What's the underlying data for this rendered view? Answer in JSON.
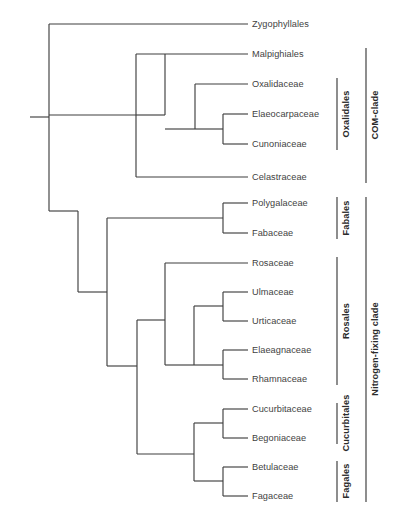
{
  "figure": {
    "type": "phylogenetic-cladogram",
    "background_color": "#ffffff",
    "line_color": "#3f3f3f",
    "text_color": "#3f3f3f",
    "width": 404,
    "height": 521
  },
  "taxa": [
    {
      "id": "zygophyllales",
      "label": "Zygophyllales",
      "x": 252,
      "y": 24
    },
    {
      "id": "malpighiales",
      "label": "Malpighiales",
      "x": 252,
      "y": 54
    },
    {
      "id": "oxalidaceae",
      "label": "Oxalidaceae",
      "x": 252,
      "y": 84
    },
    {
      "id": "elaeocarpaceae",
      "label": "Elaeocarpaceae",
      "x": 252,
      "y": 114
    },
    {
      "id": "cunoniaceae",
      "label": "Cunoniaceae",
      "x": 252,
      "y": 144
    },
    {
      "id": "celastraceae",
      "label": "Celastraceae",
      "x": 252,
      "y": 177
    },
    {
      "id": "polygalaceae",
      "label": "Polygalaceae",
      "x": 252,
      "y": 203
    },
    {
      "id": "fabaceae",
      "label": "Fabaceae",
      "x": 252,
      "y": 233
    },
    {
      "id": "rosaceae",
      "label": "Rosaceae",
      "x": 252,
      "y": 263
    },
    {
      "id": "ulmaceae",
      "label": "Ulmaceae",
      "x": 252,
      "y": 292
    },
    {
      "id": "urticaceae",
      "label": "Urticaceae",
      "x": 252,
      "y": 321
    },
    {
      "id": "elaeagnaceae",
      "label": "Elaeagnaceae",
      "x": 252,
      "y": 350
    },
    {
      "id": "rhamnaceae",
      "label": "Rhamnaceae",
      "x": 252,
      "y": 379
    },
    {
      "id": "cucurbitaceae",
      "label": "Cucurbitaceae",
      "x": 252,
      "y": 409
    },
    {
      "id": "begoniaceae",
      "label": "Begoniaceae",
      "x": 252,
      "y": 438
    },
    {
      "id": "betulaceae",
      "label": "Betulaceae",
      "x": 252,
      "y": 467
    },
    {
      "id": "fagaceae",
      "label": "Fagaceae",
      "x": 252,
      "y": 496
    }
  ],
  "clades": [
    {
      "id": "oxalidales",
      "label": "Oxalidales",
      "bracket_x": 337,
      "bracket_top": 78,
      "bracket_bottom": 150,
      "label_x": 341,
      "label_center_y": 114
    },
    {
      "id": "fabales",
      "label": "Fabales",
      "bracket_x": 337,
      "bracket_top": 197,
      "bracket_bottom": 239,
      "label_x": 341,
      "label_center_y": 218
    },
    {
      "id": "rosales",
      "label": "Rosales",
      "bracket_x": 337,
      "bracket_top": 257,
      "bracket_bottom": 385,
      "label_x": 341,
      "label_center_y": 321
    },
    {
      "id": "cucurbitales",
      "label": "Cucurbitales",
      "bracket_x": 337,
      "bracket_top": 403,
      "bracket_bottom": 444,
      "label_x": 341,
      "label_center_y": 423
    },
    {
      "id": "fagales",
      "label": "Fagales",
      "bracket_x": 337,
      "bracket_top": 461,
      "bracket_bottom": 502,
      "label_x": 341,
      "label_center_y": 481
    },
    {
      "id": "com-clade",
      "label": "COM-clade",
      "bracket_x": 366,
      "bracket_top": 48,
      "bracket_bottom": 183,
      "label_x": 370,
      "label_center_y": 115
    },
    {
      "id": "nitrogen-fixing-clade",
      "label": "Nitrogen-fixing clade",
      "bracket_x": 366,
      "bracket_top": 197,
      "bracket_bottom": 502,
      "label_x": 370,
      "label_center_y": 349
    }
  ],
  "tree_edges": {
    "root_stem": {
      "x1": 30,
      "y1": 117,
      "x2": 49,
      "y2": 117
    },
    "verticals": [
      {
        "id": "v-root",
        "x": 49,
        "y1": 24,
        "y2": 211
      },
      {
        "id": "v-com",
        "x": 136,
        "y1": 54,
        "y2": 177
      },
      {
        "id": "v-oxalidales-anc",
        "x": 165,
        "y1": 54,
        "y2": 115
      },
      {
        "id": "v-oxalidales",
        "x": 195,
        "y1": 84,
        "y2": 129
      },
      {
        "id": "v-elaeo-cunon",
        "x": 223,
        "y1": 114,
        "y2": 144
      },
      {
        "id": "v-nfix-root",
        "x": 78,
        "y1": 211,
        "y2": 292
      },
      {
        "id": "v-nfix",
        "x": 107,
        "y1": 218,
        "y2": 366
      },
      {
        "id": "v-fabales",
        "x": 223,
        "y1": 203,
        "y2": 233
      },
      {
        "id": "v-rosales",
        "x": 137,
        "y1": 320,
        "y2": 454
      },
      {
        "id": "v-rosales-main",
        "x": 165,
        "y1": 263,
        "y2": 365
      },
      {
        "id": "v-ulm-urt-elaeag",
        "x": 194,
        "y1": 306,
        "y2": 365
      },
      {
        "id": "v-ulm-urt",
        "x": 223,
        "y1": 292,
        "y2": 321
      },
      {
        "id": "v-elaeag-rham",
        "x": 223,
        "y1": 350,
        "y2": 379
      },
      {
        "id": "v-cucurb-fagales",
        "x": 194,
        "y1": 423,
        "y2": 481
      },
      {
        "id": "v-cucurbitales",
        "x": 223,
        "y1": 409,
        "y2": 438
      },
      {
        "id": "v-fagales",
        "x": 223,
        "y1": 467,
        "y2": 496
      }
    ],
    "horizontals": [
      {
        "id": "h-zygophyllales",
        "x1": 49,
        "x2": 248,
        "y": 24
      },
      {
        "id": "h-com-node",
        "x1": 49,
        "x2": 136,
        "y": 115
      },
      {
        "id": "h-malpighiales",
        "x1": 136,
        "x2": 248,
        "y": 54
      },
      {
        "id": "h-oxalidales-anc",
        "x1": 136,
        "x2": 165,
        "y": 115
      },
      {
        "id": "h-oxalidaceae",
        "x1": 195,
        "x2": 248,
        "y": 84
      },
      {
        "id": "h-oxalidales-stem",
        "x1": 165,
        "x2": 195,
        "y": 129
      },
      {
        "id": "h-elaeocarpaceae",
        "x1": 223,
        "x2": 248,
        "y": 114
      },
      {
        "id": "h-cunoniaceae",
        "x1": 223,
        "x2": 248,
        "y": 144
      },
      {
        "id": "h-elaeo-stem",
        "x1": 195,
        "x2": 223,
        "y": 129
      },
      {
        "id": "h-celastraceae",
        "x1": 136,
        "x2": 248,
        "y": 177
      },
      {
        "id": "h-nfix-root",
        "x1": 49,
        "x2": 78,
        "y": 211
      },
      {
        "id": "h-nfix-stem",
        "x1": 78,
        "x2": 107,
        "y": 292
      },
      {
        "id": "h-fabales-stem",
        "x1": 107,
        "x2": 223,
        "y": 218
      },
      {
        "id": "h-polygalaceae",
        "x1": 223,
        "x2": 248,
        "y": 203
      },
      {
        "id": "h-fabaceae",
        "x1": 223,
        "x2": 248,
        "y": 233
      },
      {
        "id": "h-ros-cuc-stem",
        "x1": 107,
        "x2": 137,
        "y": 366
      },
      {
        "id": "h-rosales-stem",
        "x1": 137,
        "x2": 165,
        "y": 320
      },
      {
        "id": "h-rosaceae",
        "x1": 165,
        "x2": 248,
        "y": 263
      },
      {
        "id": "h-ulm-clade",
        "x1": 165,
        "x2": 194,
        "y": 365
      },
      {
        "id": "h-ulm-urt-stem",
        "x1": 194,
        "x2": 223,
        "y": 306
      },
      {
        "id": "h-ulmaceae",
        "x1": 223,
        "x2": 248,
        "y": 292
      },
      {
        "id": "h-urticaceae",
        "x1": 223,
        "x2": 248,
        "y": 321
      },
      {
        "id": "h-elaeag-stem",
        "x1": 194,
        "x2": 223,
        "y": 365
      },
      {
        "id": "h-elaeagnaceae",
        "x1": 223,
        "x2": 248,
        "y": 350
      },
      {
        "id": "h-rhamnaceae",
        "x1": 223,
        "x2": 248,
        "y": 379
      },
      {
        "id": "h-cucfag-stem",
        "x1": 137,
        "x2": 194,
        "y": 454
      },
      {
        "id": "h-cucurb-stem",
        "x1": 194,
        "x2": 223,
        "y": 423
      },
      {
        "id": "h-cucurbitaceae",
        "x1": 223,
        "x2": 248,
        "y": 409
      },
      {
        "id": "h-begoniaceae",
        "x1": 223,
        "x2": 248,
        "y": 438
      },
      {
        "id": "h-fagales-stem",
        "x1": 194,
        "x2": 223,
        "y": 481
      },
      {
        "id": "h-betulaceae",
        "x1": 223,
        "x2": 248,
        "y": 467
      },
      {
        "id": "h-fagaceae",
        "x1": 223,
        "x2": 248,
        "y": 496
      }
    ]
  },
  "caption": {
    "line1": "",
    "visible": false
  }
}
